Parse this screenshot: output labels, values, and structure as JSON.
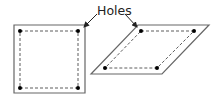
{
  "diagram": {
    "label": "Holes",
    "shapes": [
      {
        "name": "square",
        "outline": [
          [
            14,
            25
          ],
          [
            85,
            25
          ],
          [
            85,
            93
          ],
          [
            14,
            93
          ]
        ],
        "dashed_inner": [
          [
            20,
            31
          ],
          [
            78,
            31
          ],
          [
            78,
            88
          ],
          [
            20,
            88
          ]
        ],
        "holes": [
          [
            20,
            31
          ],
          [
            78,
            31
          ],
          [
            20,
            88
          ],
          [
            78,
            88
          ]
        ]
      },
      {
        "name": "parallelogram",
        "outline": [
          [
            138,
            25
          ],
          [
            209,
            25
          ],
          [
            162,
            74
          ],
          [
            91,
            74
          ]
        ],
        "dashed_inner": [
          [
            141,
            31
          ],
          [
            194,
            31
          ],
          [
            157,
            68
          ],
          [
            105,
            68
          ]
        ],
        "holes": [
          [
            141,
            31
          ],
          [
            194,
            31
          ],
          [
            105,
            68
          ],
          [
            157,
            68
          ]
        ]
      }
    ],
    "arrows": [
      {
        "from": [
          97,
          14
        ],
        "to": [
          83,
          28
        ]
      },
      {
        "from": [
          125,
          14
        ],
        "to": [
          137,
          28
        ]
      }
    ],
    "colors": {
      "stroke": "#333333",
      "outline": "#666666",
      "dot": "#111111"
    }
  }
}
